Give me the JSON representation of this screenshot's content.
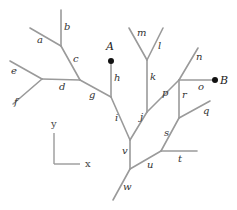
{
  "diagram": {
    "colors": {
      "edge": "#9a9a9a",
      "dot": "#111111",
      "text": "#333333"
    },
    "points": [
      {
        "label": "A",
        "x": 111,
        "y": 61,
        "lx": 106,
        "ly": 50
      },
      {
        "label": "B",
        "x": 215,
        "y": 80,
        "lx": 220,
        "ly": 84
      }
    ],
    "edges": [
      {
        "label": "a",
        "x1": 30,
        "y1": 28,
        "x2": 61,
        "y2": 46,
        "lx": 37,
        "ly": 43
      },
      {
        "label": "b",
        "x1": 61,
        "y1": 10,
        "x2": 61,
        "y2": 46,
        "lx": 64,
        "ly": 30
      },
      {
        "label": "c",
        "x1": 61,
        "y1": 46,
        "x2": 80,
        "y2": 80,
        "lx": 73,
        "ly": 62
      },
      {
        "label": "d",
        "x1": 42,
        "y1": 79,
        "x2": 80,
        "y2": 80,
        "lx": 59,
        "ly": 90
      },
      {
        "label": "e",
        "x1": 10,
        "y1": 61,
        "x2": 42,
        "y2": 79,
        "lx": 11,
        "ly": 74
      },
      {
        "label": "f",
        "x1": 13,
        "y1": 104,
        "x2": 42,
        "y2": 79,
        "lx": 14,
        "ly": 105
      },
      {
        "label": "g",
        "x1": 80,
        "y1": 80,
        "x2": 111,
        "y2": 97,
        "lx": 89,
        "ly": 98
      },
      {
        "label": "h",
        "x1": 111,
        "y1": 61,
        "x2": 111,
        "y2": 97,
        "lx": 114,
        "ly": 81
      },
      {
        "label": "i",
        "x1": 111,
        "y1": 97,
        "x2": 130,
        "y2": 140,
        "lx": 115,
        "ly": 121
      },
      {
        "label": "j",
        "x1": 130,
        "y1": 140,
        "x2": 147,
        "y2": 112,
        "lx": 140,
        "ly": 120
      },
      {
        "label": "k",
        "x1": 147,
        "y1": 60,
        "x2": 147,
        "y2": 112,
        "lx": 150,
        "ly": 80
      },
      {
        "label": "l",
        "x1": 147,
        "y1": 60,
        "x2": 163,
        "y2": 28,
        "lx": 158,
        "ly": 49
      },
      {
        "label": "m",
        "x1": 147,
        "y1": 60,
        "x2": 129,
        "y2": 28,
        "lx": 137,
        "ly": 36
      },
      {
        "label": "n",
        "x1": 179,
        "y1": 80,
        "x2": 198,
        "y2": 48,
        "lx": 196,
        "ly": 60
      },
      {
        "label": "o",
        "x1": 179,
        "y1": 80,
        "x2": 215,
        "y2": 80,
        "lx": 198,
        "ly": 90
      },
      {
        "label": "p",
        "x1": 147,
        "y1": 112,
        "x2": 179,
        "y2": 80,
        "lx": 162,
        "ly": 96
      },
      {
        "label": "r",
        "x1": 179,
        "y1": 80,
        "x2": 179,
        "y2": 118,
        "lx": 182,
        "ly": 98
      },
      {
        "label": "q",
        "x1": 179,
        "y1": 118,
        "x2": 210,
        "y2": 101,
        "lx": 203,
        "ly": 114
      },
      {
        "label": "s",
        "x1": 179,
        "y1": 118,
        "x2": 161,
        "y2": 151,
        "lx": 164,
        "ly": 136
      },
      {
        "label": "t",
        "x1": 161,
        "y1": 151,
        "x2": 197,
        "y2": 151,
        "lx": 178,
        "ly": 162
      },
      {
        "label": "u",
        "x1": 161,
        "y1": 151,
        "x2": 130,
        "y2": 169,
        "lx": 147,
        "ly": 168
      },
      {
        "label": "v",
        "x1": 130,
        "y1": 140,
        "x2": 130,
        "y2": 169,
        "lx": 122,
        "ly": 154
      },
      {
        "label": "w",
        "x1": 130,
        "y1": 169,
        "x2": 113,
        "y2": 200,
        "lx": 123,
        "ly": 190
      }
    ],
    "axes": {
      "origin": {
        "x": 54,
        "y": 164
      },
      "y_end": {
        "x": 54,
        "y": 133
      },
      "x_end": {
        "x": 80,
        "y": 164
      },
      "x_label": "x",
      "y_label": "y",
      "x_label_pos": {
        "x": 85,
        "y": 167
      },
      "y_label_pos": {
        "x": 51,
        "y": 127
      }
    }
  }
}
